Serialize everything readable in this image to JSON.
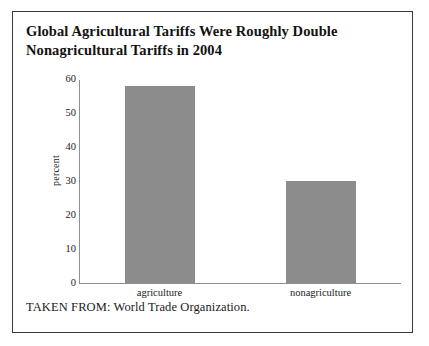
{
  "figure": {
    "title_lines": [
      "Global Agricultural Tariffs Were Roughly Double",
      "Nonagricultural Tariffs in 2004"
    ],
    "source_note": "TAKEN FROM: World Trade Organization.",
    "border_color": "#3a3a3a",
    "background": "#ffffff"
  },
  "chart_data": {
    "type": "bar",
    "title": "Global Agricultural Tariffs Were Roughly Double Nonagricultural Tariffs in 2004",
    "categories": [
      "agriculture",
      "nonagriculture"
    ],
    "values": [
      58,
      30
    ],
    "xlabel": "",
    "ylabel": "percent",
    "ylim": [
      0,
      60
    ],
    "yticks": [
      0,
      10,
      20,
      30,
      40,
      50,
      60
    ],
    "ytick_labels": [
      "0",
      "10",
      "20",
      "30",
      "40",
      "50",
      "60"
    ],
    "grid": false,
    "legend": false,
    "bar_color": "#8c8c8c",
    "axis_color": "#8f8f8f"
  }
}
